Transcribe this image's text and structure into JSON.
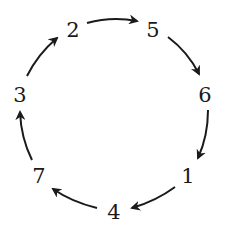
{
  "diagram": {
    "type": "cycle",
    "nodes": [
      {
        "id": "n2",
        "label": "2",
        "x": 73,
        "y": 30
      },
      {
        "id": "n5",
        "label": "5",
        "x": 153,
        "y": 30
      },
      {
        "id": "n6",
        "label": "6",
        "x": 205,
        "y": 95
      },
      {
        "id": "n1",
        "label": "1",
        "x": 188,
        "y": 176
      },
      {
        "id": "n4",
        "label": "4",
        "x": 114,
        "y": 212
      },
      {
        "id": "n7",
        "label": "7",
        "x": 39,
        "y": 176
      },
      {
        "id": "n3",
        "label": "3",
        "x": 20,
        "y": 95
      }
    ],
    "edges": [
      {
        "from": "2",
        "to": "5"
      },
      {
        "from": "5",
        "to": "6"
      },
      {
        "from": "6",
        "to": "1"
      },
      {
        "from": "1",
        "to": "4"
      },
      {
        "from": "4",
        "to": "7"
      },
      {
        "from": "7",
        "to": "3"
      },
      {
        "from": "3",
        "to": "2"
      }
    ],
    "cycle_order": [
      "2",
      "5",
      "6",
      "1",
      "4",
      "7",
      "3"
    ],
    "colors": {
      "background": "#ffffff",
      "stroke": "#1a1a1a",
      "text": "#1a1a1a"
    }
  }
}
